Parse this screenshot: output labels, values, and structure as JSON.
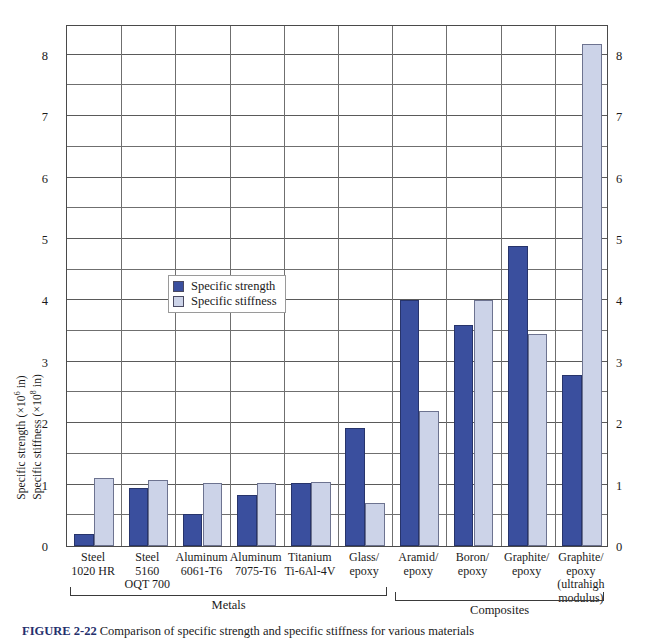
{
  "chart_data": {
    "type": "bar",
    "title": "",
    "xlabel": "",
    "ylabel_line1": "Specific strength (×10⁶ in)",
    "ylabel_line2": "Specific stiffness (×10⁸ in)",
    "ylim": [
      0,
      8.5
    ],
    "ytick_labels": [
      "0",
      "1",
      "2",
      "3",
      "4",
      "5",
      "6",
      "7",
      "8"
    ],
    "ytick_values": [
      0,
      1,
      2,
      3,
      4,
      5,
      6,
      7,
      8
    ],
    "grid": "horizontal gridlines every 0.5 units, vertical separators between categories",
    "legend_position": "inside-left-middle",
    "categories": [
      "Steel 1020 HR",
      "Steel 5160 OQT 700",
      "Aluminum 6061-T6",
      "Aluminum 7075-T6",
      "Titanium Ti-6Al-4V",
      "Glass/epoxy",
      "Aramid/epoxy",
      "Boron/epoxy",
      "Graphite/epoxy",
      "Graphite/epoxy (ultrahigh modulus)"
    ],
    "series": [
      {
        "name": "Specific strength",
        "color": "#3a4f9e",
        "values": [
          0.2,
          0.95,
          0.52,
          0.83,
          1.03,
          1.92,
          4.0,
          3.6,
          4.88,
          2.78
        ]
      },
      {
        "name": "Specific stiffness",
        "color": "#ccd3e8",
        "values": [
          1.1,
          1.07,
          1.03,
          1.03,
          1.05,
          0.7,
          2.2,
          4.0,
          3.45,
          8.17
        ]
      }
    ],
    "groups": [
      {
        "name": "Metals",
        "first": 0,
        "last": 5
      },
      {
        "name": "Composites",
        "first": 6,
        "last": 9
      }
    ]
  },
  "category_labels": [
    [
      "Steel",
      "1020 HR"
    ],
    [
      "Steel",
      "5160",
      "OQT 700"
    ],
    [
      "Aluminum",
      "6061-T6"
    ],
    [
      "Aluminum",
      "7075-T6"
    ],
    [
      "Titanium",
      "Ti-6Al-4V"
    ],
    [
      "Glass/",
      "epoxy"
    ],
    [
      "Aramid/",
      "epoxy"
    ],
    [
      "Boron/",
      "epoxy"
    ],
    [
      "Graphite/",
      "epoxy"
    ],
    [
      "Graphite/",
      "epoxy",
      "(ultrahigh",
      "modulus)"
    ]
  ],
  "legend": {
    "items": [
      {
        "label": "Specific strength",
        "swatch": "strength"
      },
      {
        "label": "Specific stiffness",
        "swatch": "stiffness"
      }
    ]
  },
  "caption": {
    "figure_number": "FIGURE 2-22",
    "text": "  Comparison of specific strength and specific stiffness for various materials"
  },
  "colors": {
    "strength": "#3a4f9e",
    "stiffness": "#ccd3e8",
    "axis": "#4a4a4a",
    "grid": "#6f6f6f",
    "background": "#ffffff"
  }
}
